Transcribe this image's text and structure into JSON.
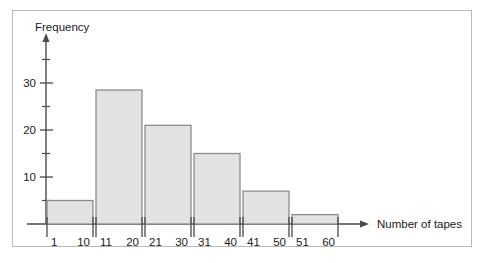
{
  "chart_data": {
    "type": "bar",
    "title": "",
    "subtitle": "",
    "xlabel": "Number of tapes",
    "ylabel": "Frequency",
    "categories": [
      "1 - 10",
      "11 - 20",
      "21 - 30",
      "31 - 40",
      "41 - 50",
      "51 - 60"
    ],
    "bin_edges_lower": [
      "1",
      "11",
      "21",
      "31",
      "41",
      "51"
    ],
    "bin_edges_upper": [
      "10",
      "20",
      "30",
      "40",
      "50",
      "60"
    ],
    "values": [
      5,
      28.5,
      21,
      15,
      7,
      2
    ],
    "xtick_labels": [
      "1",
      "10",
      "11",
      "20",
      "21",
      "30",
      "31",
      "40",
      "41",
      "50",
      "51",
      "60"
    ],
    "ytick_labels": [
      "10",
      "20",
      "30"
    ],
    "ytick_values": [
      10,
      20,
      30
    ],
    "yminor_tick_values": [
      5,
      15,
      25,
      35
    ],
    "ylim": [
      0,
      38
    ],
    "xlim": [
      0,
      6
    ],
    "grid": false,
    "legend": null,
    "legend_position": "none",
    "axis_arrows": true,
    "bar_fill_color": "#e2e2e2",
    "bar_border_color": "#8d8d8d",
    "axis_color": "#4a4a4a",
    "frame_border_color": "#b9b9b9",
    "background_color": "#ffffff"
  }
}
